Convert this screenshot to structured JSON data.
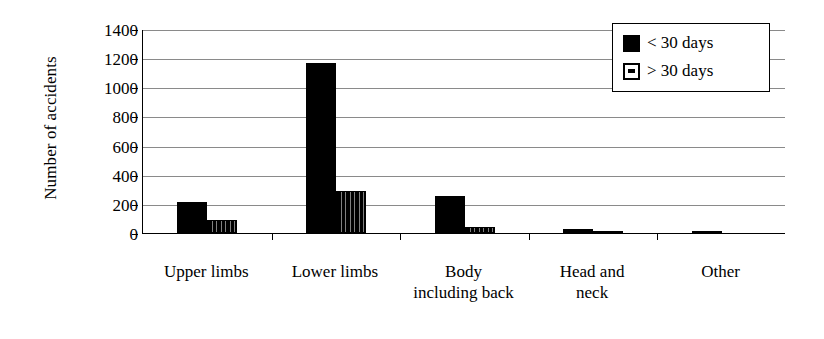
{
  "chart_data": {
    "type": "bar",
    "title": "",
    "xlabel": "",
    "ylabel": "Number of accidents",
    "ylim": [
      0,
      1400
    ],
    "ytick_labels": [
      "1400",
      "1200",
      "1000",
      "800",
      "600",
      "400",
      "200",
      "0"
    ],
    "ytick_values": [
      1400,
      1200,
      1000,
      800,
      600,
      400,
      200,
      0
    ],
    "grid": true,
    "legend_position": "top-right",
    "categories": [
      "Upper limbs",
      "Lower limbs",
      "Body including back",
      "Head and neck",
      "Other"
    ],
    "category_lines": [
      [
        "Upper limbs"
      ],
      [
        "Lower limbs"
      ],
      [
        "Body",
        "including back"
      ],
      [
        "Head and",
        "neck"
      ],
      [
        "Other"
      ]
    ],
    "series": [
      {
        "name": "< 30 days",
        "fill": "solid-black",
        "color": "#000000",
        "values": [
          210,
          1170,
          255,
          30,
          8
        ]
      },
      {
        "name": "> 30 days",
        "fill": "dotted-pattern",
        "color": "#000000",
        "values": [
          90,
          290,
          40,
          5,
          0
        ]
      }
    ]
  },
  "legend": {
    "entries": [
      {
        "label": "< 30 days",
        "swatch": "solid"
      },
      {
        "label": "> 30 days",
        "swatch": "dotted"
      }
    ]
  }
}
